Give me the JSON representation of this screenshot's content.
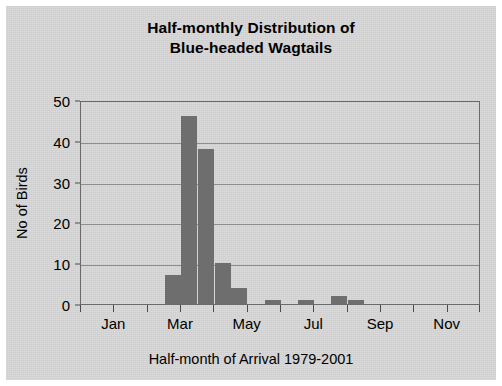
{
  "chart_data": {
    "type": "bar",
    "title": "Half-monthly Distribution of Blue-headed Wagtails",
    "title_line1": "Half-monthly Distribution of",
    "title_line2": "Blue-headed Wagtails",
    "xlabel": "Half-month of Arrival 1979-2001",
    "ylabel": "No of Birds",
    "ylim": [
      0,
      50
    ],
    "ytick_labels": [
      "0",
      "10",
      "20",
      "30",
      "40",
      "50"
    ],
    "ytick_values": [
      0,
      10,
      20,
      30,
      40,
      50
    ],
    "grid": true,
    "legend": "none",
    "bar_color": "#6e6e6e",
    "plot_bg": "#cecece",
    "axis_color": "#6a6a6a",
    "categories": [
      "Jan-1",
      "Jan-2",
      "Feb-1",
      "Feb-2",
      "Mar-1",
      "Mar-2",
      "Apr-1",
      "Apr-2",
      "May-1",
      "May-2",
      "Jun-1",
      "Jun-2",
      "Jul-1",
      "Jul-2",
      "Aug-1",
      "Aug-2",
      "Sep-1",
      "Sep-2",
      "Oct-1",
      "Oct-2",
      "Nov-1",
      "Nov-2",
      "Dec-1",
      "Dec-2"
    ],
    "values": [
      0,
      0,
      0,
      0,
      0,
      7,
      46,
      38,
      10,
      4,
      0,
      1,
      0,
      1,
      0,
      2,
      1,
      0,
      0,
      0,
      0,
      0,
      0,
      0
    ],
    "xtick_labels": [
      "Jan",
      "Mar",
      "May",
      "Jul",
      "Sep",
      "Nov"
    ],
    "xtick_category_index": [
      0,
      4,
      8,
      12,
      16,
      20
    ],
    "xtick_all_positions": [
      0,
      2,
      4,
      6,
      8,
      10,
      12,
      14,
      16,
      18,
      20,
      22,
      24
    ]
  }
}
